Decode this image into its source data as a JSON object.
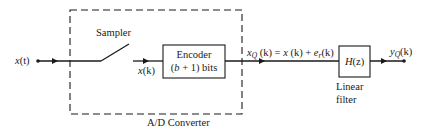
{
  "diagram": {
    "input_signal": {
      "var": "x",
      "arg": "(t)"
    },
    "sampler_label": "Sampler",
    "sampled_signal": {
      "var": "x",
      "arg": "(k)"
    },
    "encoder": {
      "line1": "Encoder",
      "line2_pre": "(",
      "line2_b": "b",
      "line2_post": " + 1) bits"
    },
    "converter_label": "A/D Converter",
    "quantized_signal": {
      "var": "x",
      "sub": "Q",
      "arg": " (k) = ",
      "var2": "x",
      "arg2": " (k) + ",
      "var3": "e",
      "sub3": "r",
      "arg3": "(k)"
    },
    "filter": {
      "label_var": "H",
      "label_arg": "(z)",
      "caption_line1": "Linear",
      "caption_line2": "filter"
    },
    "output_signal": {
      "var": "y",
      "sub": "Q",
      "arg": "(k)"
    }
  },
  "colors": {
    "stroke": "#1a1a1a",
    "background": "#ffffff"
  }
}
